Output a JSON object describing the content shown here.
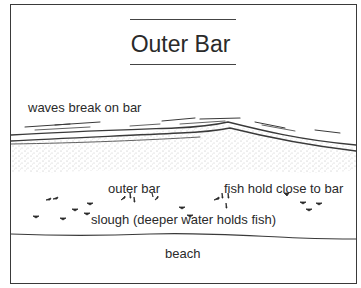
{
  "diagram": {
    "title": "Outer Bar",
    "labels": {
      "waves": "waves break on bar",
      "outer_bar": "outer bar",
      "fish_hold": "fish hold close to bar",
      "slough": "slough (deeper water holds fish)",
      "beach": "beach"
    },
    "colors": {
      "line": "#3a3a3a",
      "text": "#2a2a2a",
      "sand_stipple": "#8a8a8a",
      "background": "#ffffff"
    }
  }
}
